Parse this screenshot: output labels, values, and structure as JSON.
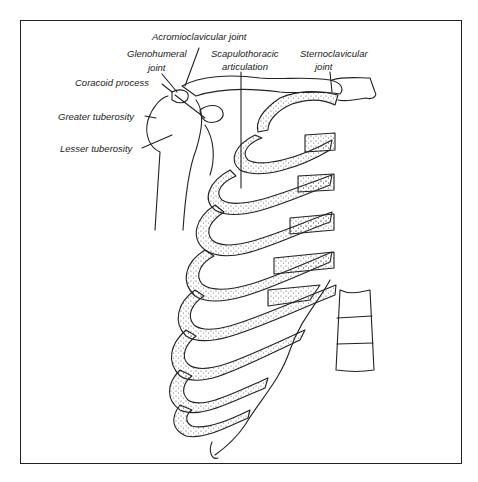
{
  "figure": {
    "type": "anatomical line drawing",
    "labels": {
      "acromioclavicular_joint": "Acromioclavicular joint",
      "glenohumeral_joint_line1": "Glenohumeral",
      "glenohumeral_joint_line2": "joint",
      "scapulothoracic_line1": "Scapulothoracic",
      "scapulothoracic_line2": "articulation",
      "sternoclavicular_line1": "Sternoclavicular",
      "sternoclavicular_line2": "joint",
      "coracoid_process": "Coracoid process",
      "greater_tuberosity": "Greater tuberosity",
      "lesser_tuberosity": "Lesser tuberosity"
    },
    "colors": {
      "line": "#222222",
      "stipple": "#555555",
      "background": "#ffffff"
    }
  }
}
